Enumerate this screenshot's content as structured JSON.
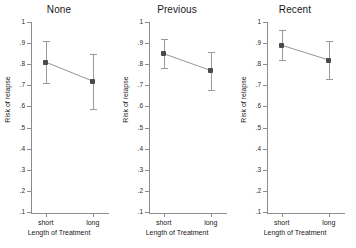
{
  "chart_data": {
    "type": "line",
    "title": "",
    "xlabel": "Length of Treatment",
    "ylabel": "Risk of relapse",
    "categories": [
      "short",
      "long"
    ],
    "ylim": [
      0.1,
      1.0
    ],
    "ytick_labels": [
      "1",
      ".9",
      ".8",
      ".7",
      ".6",
      ".5",
      ".4",
      ".3",
      ".2",
      ".1"
    ],
    "ytick_values": [
      1.0,
      0.9,
      0.8,
      0.7,
      0.6,
      0.5,
      0.4,
      0.3,
      0.2,
      0.1
    ],
    "grid": false,
    "legend": "none",
    "error_bars": "95% confidence interval",
    "panels": [
      {
        "title": "None",
        "values": [
          0.81,
          0.72
        ],
        "ci_low": [
          0.71,
          0.59
        ],
        "ci_high": [
          0.91,
          0.85
        ]
      },
      {
        "title": "Previous",
        "values": [
          0.85,
          0.77
        ],
        "ci_low": [
          0.78,
          0.68
        ],
        "ci_high": [
          0.92,
          0.86
        ]
      },
      {
        "title": "Recent",
        "values": [
          0.89,
          0.82
        ],
        "ci_low": [
          0.82,
          0.73
        ],
        "ci_high": [
          0.96,
          0.91
        ]
      }
    ]
  }
}
